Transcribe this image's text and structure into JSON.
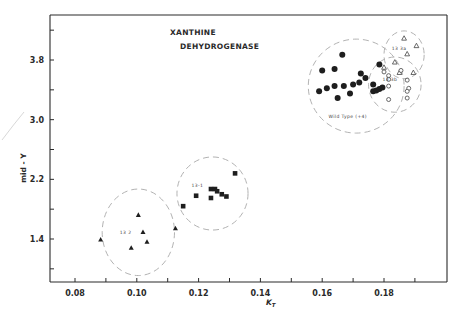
{
  "chart_data": {
    "type": "scatter",
    "title": "XANTHINE DEHYDROGENASE",
    "title_lines": [
      "XANTHINE",
      "DEHYDROGENASE"
    ],
    "xlabel": "K_T",
    "xlabel_main": "K",
    "xlabel_sub": "T",
    "ylabel": "mid - Y",
    "xlim": [
      0.072,
      0.2
    ],
    "ylim": [
      0.8,
      4.4
    ],
    "x_ticks": [
      0.08,
      0.09,
      0.1,
      0.11,
      0.12,
      0.13,
      0.14,
      0.15,
      0.16,
      0.17,
      0.18,
      0.19
    ],
    "x_tick_labels": [
      {
        "value": 0.08,
        "label": "0.08"
      },
      {
        "value": 0.1,
        "label": "0.10"
      },
      {
        "value": 0.12,
        "label": "0.12"
      },
      {
        "value": 0.14,
        "label": "0.14"
      },
      {
        "value": 0.16,
        "label": "0.16"
      },
      {
        "value": 0.18,
        "label": "0.18"
      }
    ],
    "y_ticks": [
      1.0,
      1.4,
      1.8,
      2.2,
      2.6,
      3.0,
      3.4,
      3.8,
      4.2
    ],
    "y_tick_labels": [
      {
        "value": 1.4,
        "label": "1.4"
      },
      {
        "value": 2.2,
        "label": "2.2"
      },
      {
        "value": 3.0,
        "label": "3.0"
      },
      {
        "value": 3.8,
        "label": "3.8"
      }
    ],
    "grid": false,
    "series": [
      {
        "name": "Wild Type (+4)",
        "label": "Wild Type (+4)",
        "marker": "filled-circle",
        "circle": {
          "cx": 0.171,
          "cy": 3.45,
          "rx": 0.0155,
          "ry": 0.63
        },
        "label_pos": {
          "x": 0.162,
          "y": 3.02
        },
        "points": [
          {
            "x": 0.1665,
            "y": 3.87
          },
          {
            "x": 0.16,
            "y": 3.66
          },
          {
            "x": 0.164,
            "y": 3.68
          },
          {
            "x": 0.1725,
            "y": 3.62
          },
          {
            "x": 0.17,
            "y": 3.47
          },
          {
            "x": 0.167,
            "y": 3.45
          },
          {
            "x": 0.164,
            "y": 3.45
          },
          {
            "x": 0.159,
            "y": 3.38
          },
          {
            "x": 0.1615,
            "y": 3.42
          },
          {
            "x": 0.169,
            "y": 3.35
          },
          {
            "x": 0.165,
            "y": 3.29
          },
          {
            "x": 0.172,
            "y": 3.5
          },
          {
            "x": 0.174,
            "y": 3.56
          },
          {
            "x": 0.1765,
            "y": 3.47
          },
          {
            "x": 0.1785,
            "y": 3.74
          },
          {
            "x": 0.1765,
            "y": 3.38
          },
          {
            "x": 0.1775,
            "y": 3.39
          },
          {
            "x": 0.1785,
            "y": 3.41
          },
          {
            "x": 0.1795,
            "y": 3.43
          }
        ]
      },
      {
        "name": "13 3a",
        "label": "13 3a",
        "marker": "open-triangle",
        "circle": {
          "cx": 0.1865,
          "cy": 3.87,
          "rx": 0.0065,
          "ry": 0.32
        },
        "label_pos": {
          "x": 0.1825,
          "y": 3.93
        },
        "points": [
          {
            "x": 0.1865,
            "y": 4.09
          },
          {
            "x": 0.1905,
            "y": 3.99
          },
          {
            "x": 0.1875,
            "y": 3.88
          },
          {
            "x": 0.1835,
            "y": 3.77
          },
          {
            "x": 0.185,
            "y": 3.63
          },
          {
            "x": 0.1895,
            "y": 3.63
          },
          {
            "x": 0.18,
            "y": 3.7
          }
        ]
      },
      {
        "name": "13 3b",
        "label": "13 3b",
        "marker": "open-circle",
        "circle": {
          "cx": 0.1835,
          "cy": 3.47,
          "rx": 0.0085,
          "ry": 0.37
        },
        "label_pos": {
          "x": 0.1795,
          "y": 3.52
        },
        "points": [
          {
            "x": 0.18,
            "y": 3.64
          },
          {
            "x": 0.1815,
            "y": 3.59
          },
          {
            "x": 0.1815,
            "y": 3.54
          },
          {
            "x": 0.1855,
            "y": 3.66
          },
          {
            "x": 0.1875,
            "y": 3.53
          },
          {
            "x": 0.188,
            "y": 3.42
          },
          {
            "x": 0.1815,
            "y": 3.45
          },
          {
            "x": 0.1875,
            "y": 3.29
          },
          {
            "x": 0.1815,
            "y": 3.27
          },
          {
            "x": 0.1875,
            "y": 3.38
          }
        ]
      },
      {
        "name": "13-1",
        "label": "13-1",
        "marker": "filled-square",
        "circle": {
          "cx": 0.1245,
          "cy": 2.01,
          "rx": 0.0115,
          "ry": 0.49
        },
        "label_pos": {
          "x": 0.1177,
          "y": 2.1
        },
        "points": [
          {
            "x": 0.1318,
            "y": 2.28
          },
          {
            "x": 0.124,
            "y": 2.07
          },
          {
            "x": 0.1253,
            "y": 2.07
          },
          {
            "x": 0.126,
            "y": 2.04
          },
          {
            "x": 0.1275,
            "y": 2.0
          },
          {
            "x": 0.129,
            "y": 1.97
          },
          {
            "x": 0.1192,
            "y": 1.98
          },
          {
            "x": 0.124,
            "y": 1.95
          },
          {
            "x": 0.115,
            "y": 1.84
          }
        ]
      },
      {
        "name": "13 2",
        "label": "13 2",
        "marker": "filled-triangle",
        "circle": {
          "cx": 0.1005,
          "cy": 1.49,
          "rx": 0.0117,
          "ry": 0.58
        },
        "label_pos": {
          "x": 0.0945,
          "y": 1.47
        },
        "points": [
          {
            "x": 0.1005,
            "y": 1.72
          },
          {
            "x": 0.102,
            "y": 1.49
          },
          {
            "x": 0.1033,
            "y": 1.36
          },
          {
            "x": 0.0982,
            "y": 1.28
          },
          {
            "x": 0.0883,
            "y": 1.39
          },
          {
            "x": 0.1125,
            "y": 1.54
          }
        ]
      }
    ]
  }
}
